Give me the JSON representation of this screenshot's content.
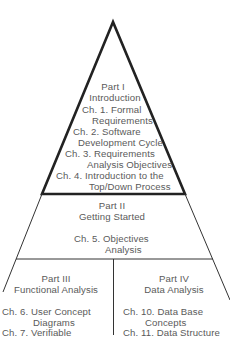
{
  "diagram": {
    "type": "pyramid",
    "colors": {
      "line": "#222222",
      "text": "#5a5a5a"
    },
    "sections": [
      {
        "id": "part1",
        "part": "Part I",
        "title": "Introduction",
        "chapters": [
          {
            "line1": "Ch. 1. Formal",
            "line2": "Requirements"
          },
          {
            "line1": "Ch. 2. Software",
            "line2": "Development Cycle"
          },
          {
            "line1": "Ch. 3. Requirements",
            "line2": "Analysis Objectives"
          },
          {
            "line1": "Ch. 4. Introduction to the",
            "line2": "Top/Down Process"
          }
        ]
      },
      {
        "id": "part2",
        "part": "Part II",
        "title": "Getting Started",
        "chapters": [
          {
            "line1": "Ch. 5. Objectives",
            "line2": "Analysis"
          }
        ]
      },
      {
        "id": "part3",
        "part": "Part III",
        "title": "Functional Analysis",
        "chapters": [
          {
            "line1": "Ch. 6. User Concept",
            "line2": "Diagrams"
          },
          {
            "line1": "Ch. 7. Verifiable"
          }
        ]
      },
      {
        "id": "part4",
        "part": "Part IV",
        "title": "Data Analysis",
        "chapters": [
          {
            "line1": "Ch. 10. Data Base",
            "line2": "Concepts"
          },
          {
            "line1": "Ch. 11. Data Structure"
          }
        ]
      }
    ]
  }
}
